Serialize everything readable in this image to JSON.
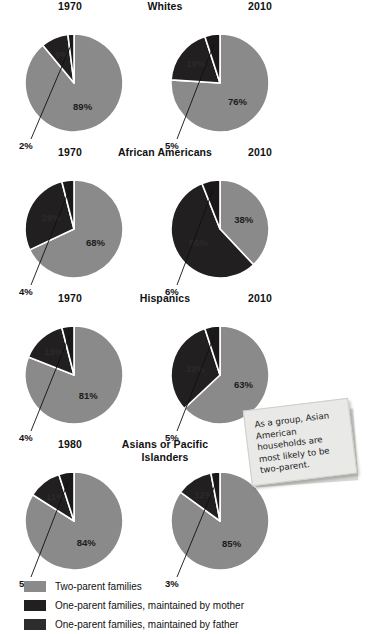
{
  "colors": {
    "two_parent": "#8a8a8a",
    "mother": "#211f1f",
    "father": "#1a1818",
    "separator": "#ffffff",
    "note_bg": "#e9e9e7",
    "text": "#111111"
  },
  "legend": {
    "items": [
      {
        "label": "Two-parent families",
        "color": "#8a8a8a",
        "key": "two_parent"
      },
      {
        "label": "One-parent families, maintained by mother",
        "color": "#211f1f",
        "key": "mother"
      },
      {
        "label": "One-parent families, maintained by father",
        "color": "#2e2c2c",
        "key": "father"
      }
    ]
  },
  "note": {
    "text": "As a group, Asian American households are most likely to be two-parent."
  },
  "chart_data": {
    "type": "pie",
    "title": "",
    "legend_position": "bottom",
    "series_names": [
      "Two-parent families",
      "One-parent families, maintained by mother",
      "One-parent families, maintained by father"
    ],
    "units": "percent",
    "groups": [
      {
        "group": "Whites",
        "charts": [
          {
            "year": "1970",
            "slices": [
              {
                "name": "Two-parent families",
                "value": 89,
                "label": "89%",
                "label_position": "inside"
              },
              {
                "name": "One-parent families, maintained by mother",
                "value": 9,
                "label": "9%",
                "label_position": "inside"
              },
              {
                "name": "One-parent families, maintained by father",
                "value": 2,
                "label": "2%",
                "label_position": "outside"
              }
            ]
          },
          {
            "year": "2010",
            "slices": [
              {
                "name": "Two-parent families",
                "value": 76,
                "label": "76%",
                "label_position": "inside"
              },
              {
                "name": "One-parent families, maintained by mother",
                "value": 19,
                "label": "19%",
                "label_position": "inside"
              },
              {
                "name": "One-parent families, maintained by father",
                "value": 5,
                "label": "5%",
                "label_position": "outside"
              }
            ]
          }
        ]
      },
      {
        "group": "African Americans",
        "charts": [
          {
            "year": "1970",
            "slices": [
              {
                "name": "Two-parent families",
                "value": 68,
                "label": "68%",
                "label_position": "inside"
              },
              {
                "name": "One-parent families, maintained by mother",
                "value": 28,
                "label": "28%",
                "label_position": "inside"
              },
              {
                "name": "One-parent families, maintained by father",
                "value": 4,
                "label": "4%",
                "label_position": "outside"
              }
            ]
          },
          {
            "year": "2010",
            "slices": [
              {
                "name": "Two-parent families",
                "value": 38,
                "label": "38%",
                "label_position": "inside"
              },
              {
                "name": "One-parent families, maintained by mother",
                "value": 56,
                "label": "56%",
                "label_position": "inside"
              },
              {
                "name": "One-parent families, maintained by father",
                "value": 6,
                "label": "6%",
                "label_position": "outside"
              }
            ]
          }
        ]
      },
      {
        "group": "Hispanics",
        "charts": [
          {
            "year": "1970",
            "slices": [
              {
                "name": "Two-parent families",
                "value": 81,
                "label": "81%",
                "label_position": "inside"
              },
              {
                "name": "One-parent families, maintained by mother",
                "value": 15,
                "label": "15%",
                "label_position": "inside"
              },
              {
                "name": "One-parent families, maintained by father",
                "value": 4,
                "label": "4%",
                "label_position": "outside"
              }
            ]
          },
          {
            "year": "2010",
            "slices": [
              {
                "name": "Two-parent families",
                "value": 63,
                "label": "63%",
                "label_position": "inside"
              },
              {
                "name": "One-parent families, maintained by mother",
                "value": 32,
                "label": "32%",
                "label_position": "inside"
              },
              {
                "name": "One-parent families, maintained by father",
                "value": 5,
                "label": "5%",
                "label_position": "outside"
              }
            ]
          }
        ]
      },
      {
        "group": "Asians or Pacific Islanders",
        "charts": [
          {
            "year": "1980",
            "slices": [
              {
                "name": "Two-parent families",
                "value": 84,
                "label": "84%",
                "label_position": "inside"
              },
              {
                "name": "One-parent families, maintained by mother",
                "value": 11,
                "label": "11%",
                "label_position": "inside"
              },
              {
                "name": "One-parent families, maintained by father",
                "value": 5,
                "label": "5%",
                "label_position": "outside"
              }
            ]
          },
          {
            "year": "2010",
            "slices": [
              {
                "name": "Two-parent families",
                "value": 85,
                "label": "85%",
                "label_position": "inside"
              },
              {
                "name": "One-parent families, maintained by mother",
                "value": 12,
                "label": "12%",
                "label_position": "inside"
              },
              {
                "name": "One-parent families, maintained by father",
                "value": 3,
                "label": "3%",
                "label_position": "outside"
              }
            ]
          }
        ]
      }
    ]
  }
}
